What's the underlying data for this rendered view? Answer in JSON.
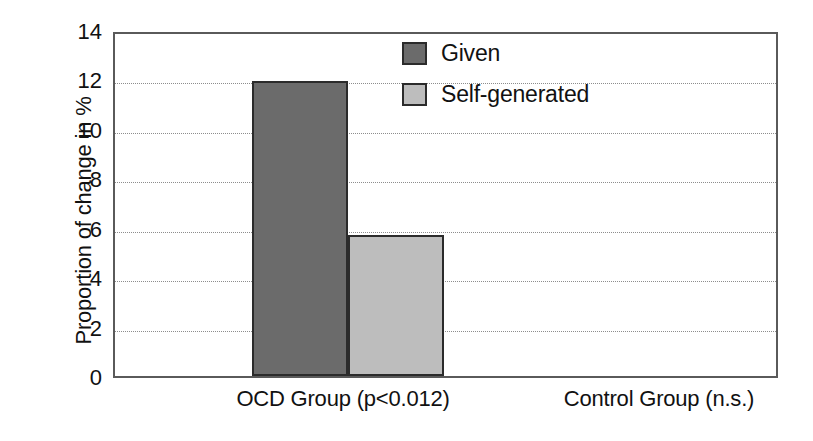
{
  "chart_data": {
    "type": "bar",
    "title": "",
    "xlabel": "",
    "ylabel": "Proportion of change in %",
    "ylim": [
      0,
      14
    ],
    "ytick_step": 2,
    "yticks": [
      "14",
      "12",
      "10",
      "8",
      "6",
      "4",
      "2",
      "0"
    ],
    "grid": true,
    "legend_position": "top-center",
    "categories": [
      "OCD Group (p<0.012)",
      "Control Group (n.s.)"
    ],
    "series": [
      {
        "name": "Given",
        "color": "#6b6b6b",
        "values": [
          11.95,
          5.35
        ]
      },
      {
        "name": "Self-generated",
        "color": "#bdbdbd",
        "values": [
          5.7,
          7.05
        ]
      }
    ]
  },
  "style": {
    "axis_color": "#5a5a5a",
    "bar_edge_color": "#2b2b2b",
    "grid_color": "#8d8d8d",
    "background": "#ffffff",
    "text_color": "#111111"
  }
}
